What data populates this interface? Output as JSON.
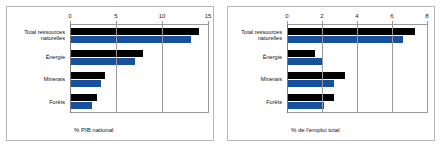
{
  "figure": {
    "panel_count": 2,
    "border_color": "#b9b9b9",
    "series_colors": {
      "dark": "#000000",
      "blue": "#16509f"
    }
  },
  "chart_data": [
    {
      "type": "bar",
      "orientation": "horizontal",
      "title": "",
      "xlabel": "% PIB national",
      "ylabel": "",
      "xlim": [
        0,
        15
      ],
      "xticks": [
        0,
        5,
        10,
        15
      ],
      "xticklabels": [
        "0",
        "5",
        "10",
        "15"
      ],
      "grid": true,
      "legend": "none",
      "categories": [
        "Total ressources naturelles",
        "Énergie",
        "Minerais",
        "Forêts"
      ],
      "category_lines": [
        [
          "Total ressources",
          "naturelles"
        ],
        [
          "Énergie"
        ],
        [
          "Minerais"
        ],
        [
          "Forêts"
        ]
      ],
      "series": [
        {
          "name": "dark",
          "color": "#000000",
          "values": [
            14.0,
            7.9,
            3.8,
            2.9
          ]
        },
        {
          "name": "blue",
          "color": "#16509f",
          "values": [
            13.2,
            7.1,
            3.4,
            2.4
          ]
        }
      ]
    },
    {
      "type": "bar",
      "orientation": "horizontal",
      "title": "",
      "xlabel": "% de l'emploi total",
      "ylabel": "",
      "xlim": [
        0,
        8
      ],
      "xticks": [
        0,
        2,
        4,
        6,
        8
      ],
      "xticklabels": [
        "0",
        "2",
        "4",
        "6",
        "8"
      ],
      "grid": true,
      "legend": "none",
      "categories": [
        "Total ressources naturelles",
        "Énergie",
        "Minerais",
        "Forêts"
      ],
      "category_lines": [
        [
          "Total ressources",
          "naturelles"
        ],
        [
          "Énergie"
        ],
        [
          "Minerais"
        ],
        [
          "Forêts"
        ]
      ],
      "series": [
        {
          "name": "dark",
          "color": "#000000",
          "values": [
            7.3,
            1.6,
            3.3,
            2.7
          ]
        },
        {
          "name": "blue",
          "color": "#16509f",
          "values": [
            6.6,
            2.0,
            2.7,
            2.1
          ]
        }
      ]
    }
  ]
}
